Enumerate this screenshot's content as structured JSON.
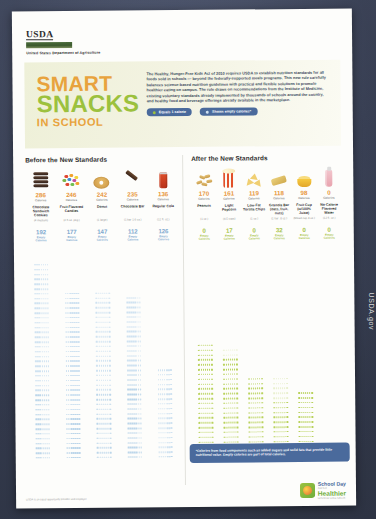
{
  "agency": {
    "logo_text": "USDA",
    "logo_icon": "usda-shield-icon",
    "subtitle": "United States Department of Agriculture"
  },
  "hero": {
    "title_line1": "SMART",
    "title_line2": "SNACKS",
    "title_line3": "IN SCHOOL",
    "paragraph": "The Healthy, Hunger-Free Kids Act of 2010 requires USDA to establish nutrition standards for all foods sold in schools — beyond the federally-supported meals programs. This new rule carefully balances science-based nutrition guidelines with practical and flexible solutions to promote healthier eating on campus. The rule draws on recommendations from the Institute of Medicine, existing voluntary standards already implemented by thousands of schools around the country, and healthy food and beverage offerings already available in the marketplace.",
    "legend": [
      {
        "label": "Equals 1 calorie",
        "swatch": "#9cc13e"
      },
      {
        "label": "Shows empty calories*",
        "swatch": "#cfe0f0"
      }
    ]
  },
  "colors": {
    "smart_orange": "#e8a33d",
    "snacks_green": "#9cc13e",
    "calorie_orange": "#e8973c",
    "empty_blue": "#7fa9cf",
    "empty_green": "#a9c44a",
    "note_blue": "#4a6a9c"
  },
  "before": {
    "title": "Before the New Standards",
    "calorie_word": "Calories",
    "empty_word_line1": "Empty",
    "empty_word_line2": "Calories",
    "items": [
      {
        "icon": "chocolate-sandwich-cookies-icon",
        "calories": 286,
        "name": "Chocolate Sandwich Cookies",
        "serving": "(4 medium)",
        "empty_calories": 192
      },
      {
        "icon": "fruit-flavored-candies-icon",
        "calories": 246,
        "name": "Fruit Flavored Candies",
        "serving": "(2.5 oz. pkg.)",
        "empty_calories": 177
      },
      {
        "icon": "donut-icon",
        "calories": 242,
        "name": "Donut",
        "serving": "(1 large)",
        "empty_calories": 147
      },
      {
        "icon": "chocolate-bar-icon",
        "calories": 235,
        "name": "Chocolate Bar",
        "serving": "(1 bar-1.6 oz.)",
        "empty_calories": 112
      },
      {
        "icon": "regular-cola-icon",
        "calories": 136,
        "name": "Regular Cola",
        "serving": "(12 fl. oz.)",
        "empty_calories": 126
      }
    ]
  },
  "after": {
    "title": "After the New Standards",
    "calorie_word": "Calories",
    "empty_word_line1": "Empty",
    "empty_word_line2": "Calories",
    "items": [
      {
        "icon": "peanuts-icon",
        "calories": 170,
        "name": "Peanuts",
        "serving": "(1 oz.)",
        "empty_calories": 0
      },
      {
        "icon": "light-popcorn-icon",
        "calories": 161,
        "name": "Light Popcorn",
        "serving": "(4.5 cups)",
        "empty_calories": 17
      },
      {
        "icon": "low-fat-tortilla-chips-icon",
        "calories": 119,
        "name": "Low-Fat Tortilla Chips",
        "serving": "(1 oz.)",
        "empty_calories": 0
      },
      {
        "icon": "granola-bar-icon",
        "calories": 118,
        "name": "Granola Bar (oats, fruit, nuts)",
        "serving": "(1 bar-.8 oz.)",
        "empty_calories": 32
      },
      {
        "icon": "fruit-cup-icon",
        "calories": 98,
        "name": "Fruit Cup (w/100% Juice)",
        "serving": "(Mixed cup 4 oz.)",
        "empty_calories": 0
      },
      {
        "icon": "no-calorie-flavored-water-icon",
        "calories": 0,
        "name": "No-Calorie Flavored Water",
        "serving": "(12 fl. oz.)",
        "empty_calories": 0
      }
    ]
  },
  "footnote": {
    "text": "*Calories from food components such as added sugars and solid fats that provide little nutritional value. Empty calories are part of total calories."
  },
  "footer": {
    "fine_print": "USDA is an equal opportunity provider and employer.",
    "logo_line1": "School Day",
    "logo_mid": "Just Got",
    "logo_line2": "Healthier",
    "logo_tagline": "Let's Move! Active Schools",
    "logo_icon": "school-day-healthier-logo"
  },
  "side_caption": "USDA.gov"
}
